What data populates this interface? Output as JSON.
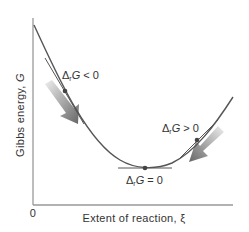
{
  "diagram": {
    "type": "gibbs-energy-vs-extent-of-reaction",
    "y_axis_label_prefix": "Gibbs energy, ",
    "y_axis_symbol": "G",
    "x_axis_label": "Extent of reaction, ξ",
    "origin_label": "0",
    "annotations": [
      {
        "id": "left",
        "delta": "Δ",
        "sub": "r",
        "symbol": "G",
        "relation": " < 0"
      },
      {
        "id": "min",
        "delta": "Δ",
        "sub": "r",
        "symbol": "G",
        "relation": " = 0"
      },
      {
        "id": "right",
        "delta": "Δ",
        "sub": "r",
        "symbol": "G",
        "relation": " > 0"
      }
    ],
    "colors": {
      "axis": "#999999",
      "curve": "#555555",
      "arrow_dark": "#666666",
      "arrow_light": "#e0e0e0",
      "text": "#333333"
    }
  }
}
